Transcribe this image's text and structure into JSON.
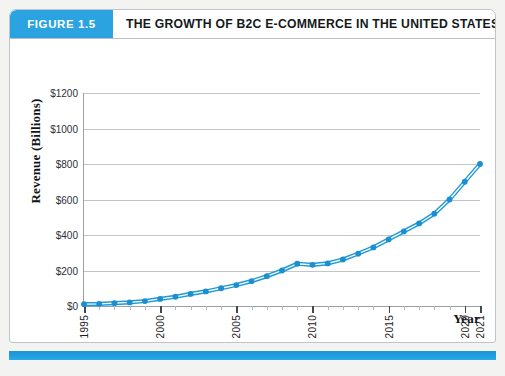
{
  "figure": {
    "badge_label": "FIGURE 1.5",
    "title": "THE GROWTH OF B2C E-COMMERCE IN THE UNITED STATES"
  },
  "colors": {
    "accent_blue": "#2ba3e0",
    "series_blue": "#1f9ad6",
    "marker_blue": "#1b8fd0",
    "gridline": "#c2c6c9",
    "axis": "#9aa0a4",
    "footer_bar": "#1e9cdd",
    "title_text": "#15191c"
  },
  "chart_data": {
    "type": "line",
    "title": "THE GROWTH OF B2C E-COMMERCE IN THE UNITED STATES",
    "xlabel": "Year",
    "ylabel": "Revenue (Billions)",
    "xlim": [
      1995,
      2021
    ],
    "ylim": [
      0,
      1200
    ],
    "grid": true,
    "legend": "none",
    "ytick_labels": [
      "$0",
      "$200",
      "$400",
      "$600",
      "$800",
      "$1000",
      "$1200"
    ],
    "ytick_values": [
      0,
      200,
      400,
      600,
      800,
      1000,
      1200
    ],
    "xtick_labels": [
      "1995",
      "2000",
      "2005",
      "2010",
      "2015",
      "2020",
      "2021"
    ],
    "xtick_values": [
      1995,
      2000,
      2005,
      2010,
      2015,
      2020,
      2021
    ],
    "x": [
      1995,
      1996,
      1997,
      1998,
      1999,
      2000,
      2001,
      2002,
      2003,
      2004,
      2005,
      2006,
      2007,
      2008,
      2009,
      2010,
      2011,
      2012,
      2013,
      2014,
      2015,
      2016,
      2017,
      2018,
      2019,
      2020,
      2021
    ],
    "series": [
      {
        "name": "B2C E-commerce Revenue",
        "values": [
          10,
          12,
          16,
          20,
          28,
          40,
          52,
          68,
          82,
          100,
          118,
          140,
          168,
          200,
          238,
          232,
          240,
          262,
          295,
          330,
          375,
          420,
          465,
          520,
          600,
          700,
          800
        ]
      }
    ],
    "units": "Billions of U.S. dollars"
  },
  "axis": {
    "y_title": "Revenue (Billions)",
    "x_title": "Year"
  }
}
